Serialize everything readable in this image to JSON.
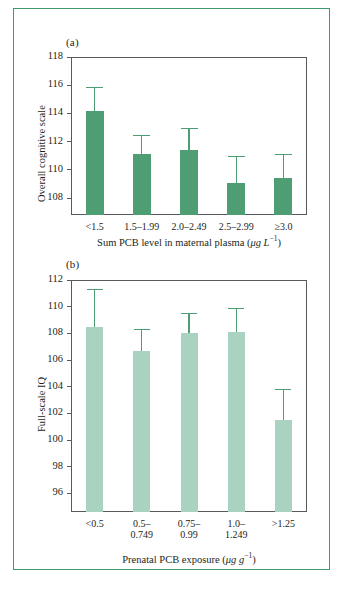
{
  "figure": {
    "frame_color": "#3f9b6d",
    "background": "#ffffff",
    "axis_color": "#58595b"
  },
  "panels": [
    {
      "tag": "(a)",
      "bar_color": "#4f9d73",
      "error_color": "#4f9d73",
      "ylabel": "Overall cognitive scale",
      "xlabel_main": "Sum PCB level in maternal plasma (",
      "xlabel_unit_mu": "μg L",
      "xlabel_sup": "−1",
      "xlabel_close": ")",
      "yticks": [
        108,
        110,
        112,
        114,
        116,
        118
      ],
      "ylim": [
        106.8,
        118
      ],
      "categories": [
        "<1.5",
        "1.5–1.99",
        "2.0–2.49",
        "2.5–2.99",
        "≥3.0"
      ],
      "values": [
        114.2,
        111.1,
        111.4,
        109.1,
        109.4
      ],
      "errors_upper": [
        115.9,
        112.45,
        113.0,
        111.0,
        111.1
      ]
    },
    {
      "tag": "(b)",
      "bar_color": "#a9d3c0",
      "error_color": "#4f9d73",
      "ylabel": "Full-scale IQ",
      "xlabel_main": "Prenatal PCB exposure (",
      "xlabel_unit_mu": "μg g",
      "xlabel_sup": "−1",
      "xlabel_close": ")",
      "yticks": [
        96,
        98,
        100,
        102,
        104,
        106,
        108,
        110,
        112
      ],
      "ylim": [
        94.6,
        112
      ],
      "categories": [
        "<0.5",
        "0.5–\n0.749",
        "0.75–\n0.99",
        "1.0–\n1.249",
        ">1.25"
      ],
      "values": [
        108.5,
        106.7,
        108.0,
        108.1,
        101.5
      ],
      "errors_upper": [
        111.3,
        108.3,
        109.5,
        109.9,
        103.8
      ]
    }
  ],
  "chart_data": [
    {
      "type": "bar",
      "panel": "(a)",
      "title": "",
      "categories": [
        "<1.5",
        "1.5–1.99",
        "2.0–2.49",
        "2.5–2.99",
        "≥3.0"
      ],
      "values": [
        114.2,
        111.1,
        111.4,
        109.1,
        109.4
      ],
      "error_upper": [
        115.9,
        112.45,
        113.0,
        111.0,
        111.1
      ],
      "xlabel": "Sum PCB level in maternal plasma (μg L⁻¹)",
      "ylabel": "Overall cognitive scale",
      "ylim": [
        106.8,
        118
      ],
      "yticks": [
        108,
        110,
        112,
        114,
        116,
        118
      ],
      "grid": false,
      "legend": "none",
      "bar_color": "#4f9d73"
    },
    {
      "type": "bar",
      "panel": "(b)",
      "title": "",
      "categories": [
        "<0.5",
        "0.5–0.749",
        "0.75–0.99",
        "1.0–1.249",
        ">1.25"
      ],
      "values": [
        108.5,
        106.7,
        108.0,
        108.1,
        101.5
      ],
      "error_upper": [
        111.3,
        108.3,
        109.5,
        109.9,
        103.8
      ],
      "xlabel": "Prenatal PCB exposure (μg g⁻¹)",
      "ylabel": "Full-scale IQ",
      "ylim": [
        94.6,
        112
      ],
      "yticks": [
        96,
        98,
        100,
        102,
        104,
        106,
        108,
        110,
        112
      ],
      "grid": false,
      "legend": "none",
      "bar_color": "#a9d3c0"
    }
  ]
}
